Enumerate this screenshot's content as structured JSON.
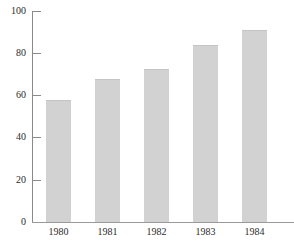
{
  "chart_data": {
    "type": "bar",
    "title": "",
    "subtitle": "",
    "xlabel": "",
    "ylabel": "",
    "categories": [
      "1980",
      "1981",
      "1982",
      "1983",
      "1984"
    ],
    "values": [
      58,
      68,
      72.5,
      84,
      91
    ],
    "series": [
      {
        "name": "",
        "values": [
          58,
          68,
          72.5,
          84,
          91
        ]
      }
    ],
    "ylim": [
      0,
      100
    ],
    "yticks": [
      0,
      20,
      40,
      60,
      80,
      100
    ],
    "ytick_labels": [
      "0",
      "20",
      "40",
      "60",
      "80",
      "100"
    ],
    "xtick_labels": [
      "1980",
      "1981",
      "1982",
      "1983",
      "1984"
    ],
    "grid": false,
    "legend": false,
    "legend_position": "none",
    "bar_color": "#d2d2d2",
    "axis_color": "#8a8a8a",
    "text_color": "#2b2b2b",
    "background_color": "#ffffff"
  }
}
